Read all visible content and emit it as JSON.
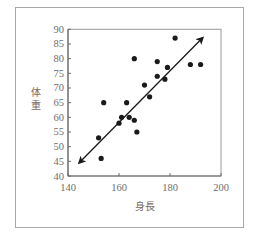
{
  "chart_data": {
    "type": "scatter",
    "title": "",
    "xlabel": "身長",
    "ylabel": "体重",
    "xlim": [
      140,
      200
    ],
    "ylim": [
      40,
      90
    ],
    "xticks": [
      140,
      160,
      180,
      200
    ],
    "yticks": [
      40,
      45,
      50,
      55,
      60,
      65,
      70,
      75,
      80,
      85,
      90
    ],
    "grid": false,
    "legend": null,
    "points": [
      {
        "x": 152,
        "y": 53
      },
      {
        "x": 153,
        "y": 46
      },
      {
        "x": 154,
        "y": 65
      },
      {
        "x": 160,
        "y": 58
      },
      {
        "x": 161,
        "y": 60
      },
      {
        "x": 163,
        "y": 65
      },
      {
        "x": 164,
        "y": 60
      },
      {
        "x": 166,
        "y": 59
      },
      {
        "x": 166,
        "y": 80
      },
      {
        "x": 167,
        "y": 55
      },
      {
        "x": 170,
        "y": 71
      },
      {
        "x": 172,
        "y": 67
      },
      {
        "x": 175,
        "y": 74
      },
      {
        "x": 175,
        "y": 79
      },
      {
        "x": 178,
        "y": 73
      },
      {
        "x": 179,
        "y": 77
      },
      {
        "x": 182,
        "y": 87
      },
      {
        "x": 188,
        "y": 78
      },
      {
        "x": 192,
        "y": 78
      }
    ],
    "annotations": [
      {
        "type": "double-arrow",
        "label": "trend line",
        "from": {
          "x": 144.4,
          "y": 44.5
        },
        "to": {
          "x": 192.8,
          "y": 87.1
        }
      }
    ]
  },
  "colors": {
    "points": "#1a1a1a",
    "axis": "#6a6a6a",
    "arrow": "#1a1a1a",
    "tick_text": "#6e6e6e",
    "frame": "#a8a8a8"
  }
}
